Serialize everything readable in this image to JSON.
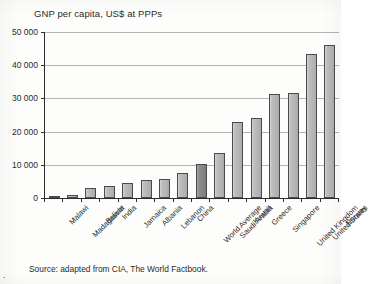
{
  "figure": {
    "caption_marker": ".",
    "source_text": "Source: adapted from CIA, The World Factbook."
  },
  "colors": {
    "bar_fill": "#bdbdbd",
    "bar_stroke": "#4a4a4a",
    "highlight_fill": "#8d8d8d",
    "gridline": "#b4b4b4",
    "axis": "#2e2e2e",
    "paper": "#fdfdfb",
    "text": "#2b2b2b"
  },
  "chart_data": {
    "type": "bar",
    "title": "GNP per capita, US$ at PPPs",
    "xlabel": "",
    "ylabel": "",
    "ylim": [
      0,
      50000
    ],
    "yticks": [
      0,
      10000,
      20000,
      30000,
      40000,
      50000
    ],
    "ytick_labels": [
      "0",
      "10 000",
      "20 000",
      "30 000",
      "40 000",
      "50 000"
    ],
    "grid": true,
    "legend": false,
    "highlight_category": "World Average",
    "categories": [
      "Malawi",
      "Madagascar",
      "Bolivia",
      "India",
      "Jamaica",
      "Albania",
      "Lebanon",
      "China",
      "World Average",
      "Saudi Arabia",
      "Kuwait",
      "Greece",
      "Singapore",
      "United Kingdom",
      "United States",
      "Norway"
    ],
    "values": [
      600,
      900,
      3000,
      3700,
      4600,
      5500,
      5800,
      7600,
      10200,
      13700,
      23000,
      24000,
      31200,
      31500,
      43500,
      46000
    ]
  }
}
